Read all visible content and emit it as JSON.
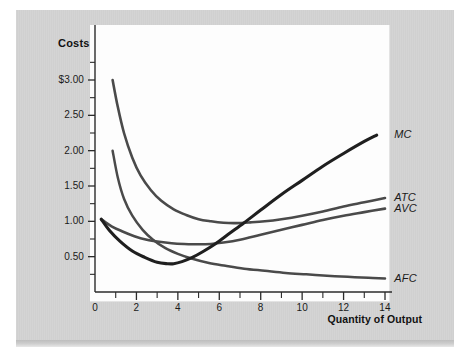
{
  "figure": {
    "background_color": "#d2d2d2",
    "plot_background_color": "#fdfdfd"
  },
  "axis": {
    "y_title": "Costs",
    "x_title": "Quantity of Output"
  },
  "chart_data": {
    "type": "line",
    "title": "",
    "subtitle": "",
    "xlabel": "Quantity of Output",
    "ylabel": "Costs",
    "xlim": [
      0,
      15
    ],
    "ylim": [
      0,
      3.25
    ],
    "grid": false,
    "legend_position": "right-inline-labels",
    "x_ticks_major": [
      0,
      2,
      4,
      6,
      8,
      10,
      12,
      14
    ],
    "x_tick_labels": [
      "0",
      "2",
      "4",
      "6",
      "8",
      "10",
      "12",
      "14"
    ],
    "x_ticks_minor": [
      1,
      3,
      5,
      7,
      9,
      11,
      13,
      15
    ],
    "y_ticks_major": [
      0.5,
      1.0,
      1.5,
      2.0,
      2.5,
      3.0
    ],
    "y_tick_labels": [
      "0.50",
      "1.00",
      "1.50",
      "2.00",
      "2.50",
      "$3.00"
    ],
    "y_ticks_minor": [
      0.25,
      0.75,
      1.25,
      1.75,
      2.25,
      2.75,
      3.25
    ],
    "series": [
      {
        "name": "MC",
        "label": "MC",
        "color": "#1f1f1f",
        "x": [
          0.3,
          0.7,
          1.2,
          1.8,
          2.4,
          3.0,
          3.5,
          3.8,
          4.2,
          4.7,
          5.2,
          5.8,
          6.5,
          7.2,
          8.0,
          9.0,
          10.0,
          11.0,
          12.0,
          13.0,
          13.6
        ],
        "y": [
          1.03,
          0.87,
          0.72,
          0.58,
          0.49,
          0.42,
          0.4,
          0.4,
          0.43,
          0.49,
          0.57,
          0.68,
          0.83,
          0.98,
          1.16,
          1.38,
          1.58,
          1.78,
          1.96,
          2.13,
          2.22
        ]
      },
      {
        "name": "AVC",
        "label": "AVC",
        "color": "#4a4a4a",
        "x": [
          0.3,
          0.8,
          1.3,
          1.9,
          2.5,
          3.1,
          3.7,
          4.3,
          5.0,
          5.6,
          6.2,
          7.0,
          8.0,
          9.0,
          10.0,
          11.0,
          12.0,
          13.0,
          14.0
        ],
        "y": [
          1.03,
          0.93,
          0.86,
          0.79,
          0.74,
          0.71,
          0.69,
          0.68,
          0.675,
          0.68,
          0.7,
          0.74,
          0.81,
          0.88,
          0.95,
          1.02,
          1.08,
          1.13,
          1.18
        ]
      },
      {
        "name": "ATC",
        "label": "ATC",
        "color": "#4a4a4a",
        "x": [
          0.85,
          1.1,
          1.4,
          1.8,
          2.2,
          2.7,
          3.2,
          3.8,
          4.4,
          5.0,
          5.6,
          6.2,
          6.8,
          7.5,
          8.2,
          9.0,
          10.0,
          11.0,
          12.0,
          13.0,
          14.0
        ],
        "y": [
          3.0,
          2.62,
          2.25,
          1.9,
          1.65,
          1.44,
          1.29,
          1.17,
          1.09,
          1.03,
          1.0,
          0.98,
          0.975,
          0.985,
          1.0,
          1.03,
          1.08,
          1.14,
          1.21,
          1.27,
          1.33
        ]
      },
      {
        "name": "AFC",
        "label": "AFC",
        "color": "#4a4a4a",
        "x": [
          0.85,
          1.1,
          1.4,
          1.8,
          2.3,
          2.8,
          3.4,
          4.0,
          4.7,
          5.5,
          6.3,
          7.2,
          8.2,
          9.2,
          10.2,
          11.2,
          12.2,
          13.2,
          14.0
        ],
        "y": [
          2.0,
          1.62,
          1.32,
          1.08,
          0.88,
          0.74,
          0.62,
          0.54,
          0.47,
          0.41,
          0.37,
          0.33,
          0.3,
          0.27,
          0.25,
          0.23,
          0.215,
          0.2,
          0.19
        ]
      }
    ],
    "annotations": [
      {
        "text": "MC",
        "x": 14.3,
        "y": 2.22
      },
      {
        "text": "ATC",
        "x": 14.3,
        "y": 1.33
      },
      {
        "text": "AVC",
        "x": 14.3,
        "y": 1.18
      },
      {
        "text": "AFC",
        "x": 14.3,
        "y": 0.19
      }
    ]
  }
}
